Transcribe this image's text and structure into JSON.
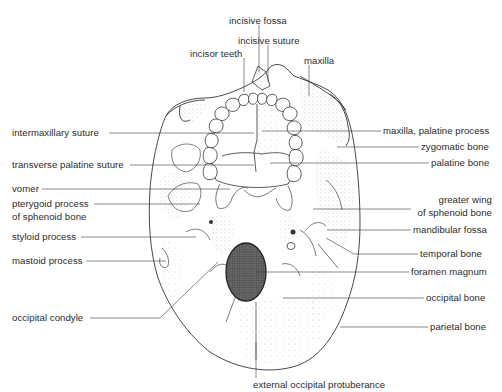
{
  "figure": {
    "colors": {
      "ink": "#2b2b2b",
      "line": "#3a3a3a",
      "stipple": "#6b6b6b",
      "foramen": "#3c3c3c",
      "background": "#ffffff"
    }
  },
  "labels": {
    "top": {
      "incisive_fossa": "incisive fossa",
      "incisive_suture": "incisive suture",
      "incisor_teeth": "incisor teeth",
      "maxilla": "maxilla"
    },
    "left": {
      "intermaxillary_suture": "intermaxillary suture",
      "transverse_palatine_suture": "transverse palatine suture",
      "vomer": "vomer",
      "pterygoid_process_1": "pterygoid process",
      "pterygoid_process_2": "of sphenoid bone",
      "styloid_process": "styloid process",
      "mastoid_process": "mastoid process",
      "occipital_condyle": "occipital condyle"
    },
    "right": {
      "maxilla_palatine_process": "maxilla, palatine process",
      "zygomatic_bone": "zygomatic bone",
      "palatine_bone": "palatine bone",
      "greater_wing_1": "greater wing",
      "greater_wing_2": "of sphenoid bone",
      "mandibular_fossa": "mandibular fossa",
      "temporal_bone": "temporal bone",
      "foramen_magnum": "foramen magnum",
      "occipital_bone": "occipital bone",
      "parietal_bone": "parietal bone"
    },
    "bottom": {
      "external_occipital_protuberance": "external occipital protuberance"
    }
  }
}
